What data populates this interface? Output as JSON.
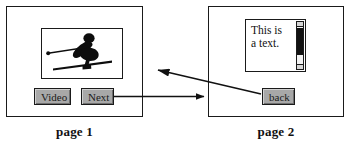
{
  "diagram": {
    "ink_color": "#1a1a1a",
    "button_face_color": "#a8a8a8"
  },
  "page1": {
    "caption": "page 1",
    "media": {
      "icon": "skier-icon",
      "alt": "skier silhouette"
    },
    "buttons": [
      {
        "name": "video-button",
        "label": "Video"
      },
      {
        "name": "next-button",
        "label": "Next"
      }
    ]
  },
  "page2": {
    "caption": "page 2",
    "textbox": {
      "value": "This is\na text.",
      "scrollbar": {
        "orientation": "vertical",
        "up_arrow": "scroll-up-icon",
        "down_arrow": "scroll-down-icon",
        "thumb": "scroll-thumb"
      }
    },
    "buttons": [
      {
        "name": "back-button",
        "label": "back"
      }
    ]
  },
  "connectors": [
    {
      "name": "next-to-page2-arrow",
      "from": "next-button",
      "to": "page2",
      "direction": "right"
    },
    {
      "name": "back-to-page1-arrow",
      "from": "back-button",
      "to": "page1",
      "direction": "left"
    }
  ]
}
